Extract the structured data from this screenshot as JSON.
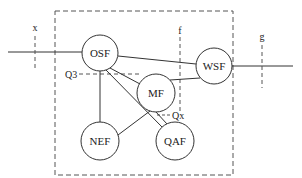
{
  "diagram": {
    "nodes": [
      {
        "id": "osf",
        "label": "OSF",
        "cx": 100,
        "cy": 53,
        "r": 18
      },
      {
        "id": "mf",
        "label": "MF",
        "cx": 156,
        "cy": 93,
        "r": 19
      },
      {
        "id": "wsf",
        "label": "WSF",
        "cx": 214,
        "cy": 66,
        "r": 18
      },
      {
        "id": "nef",
        "label": "NEF",
        "cx": 100,
        "cy": 141,
        "r": 19
      },
      {
        "id": "qaf",
        "label": "QAF",
        "cx": 175,
        "cy": 141,
        "r": 19
      }
    ],
    "reference_points": {
      "x": "x",
      "f": "f",
      "g": "g",
      "q3": "Q3",
      "qx": "Qx"
    },
    "colors": {
      "line": "#333333",
      "dashed": "#555555",
      "background": "#ffffff"
    }
  }
}
